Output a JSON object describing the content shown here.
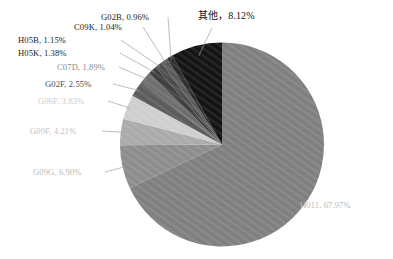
{
  "chart_data": {
    "type": "pie",
    "title": "",
    "legend": "none",
    "start_angle_deg": 0,
    "direction": "clockwise",
    "labels_show_category_and_percent": true,
    "categories": [
      "H011",
      "G09G",
      "G09F",
      "G06F",
      "G02F",
      "C07D",
      "H05K",
      "H05B",
      "C09K",
      "G02B",
      "其他"
    ],
    "values": [
      67.97,
      6.9,
      4.21,
      3.83,
      2.55,
      1.89,
      1.38,
      1.15,
      1.04,
      0.96,
      8.12
    ],
    "unit": "%",
    "slices": [
      {
        "name": "H011",
        "value": 67.97,
        "label": "H011, 67.97%",
        "color": "#808080",
        "label_color": "#b7b7b7"
      },
      {
        "name": "G09G",
        "value": 6.9,
        "label": "G09G, 6.90%",
        "color": "#8d8d8d",
        "label_color": "#b7b7b7"
      },
      {
        "name": "G09F",
        "value": 4.21,
        "label": "G09F, 4.21%",
        "color": "#ababab",
        "label_color": "#c2c2c2"
      },
      {
        "name": "G06F",
        "value": 3.83,
        "label": "G06F, 3.83%",
        "color": "#cfcfcf",
        "label_color": "#cccccc"
      },
      {
        "name": "G02F",
        "value": 2.55,
        "label": "G02F, 2.55%",
        "color": "#5c5c5c",
        "label_color": "#4a4a4a"
      },
      {
        "name": "C07D",
        "value": 1.89,
        "label": "C07D, 1.89%",
        "color": "#6e6e6e",
        "label_color": "#8a8a8a"
      },
      {
        "name": "H05K",
        "value": 1.38,
        "label": "H05K, 1.38%",
        "color": "#3f3f3f",
        "label_color": "#1a1a1a"
      },
      {
        "name": "H05B",
        "value": 1.15,
        "label": "H05B, 1.15%",
        "color": "#4d4d4d",
        "label_color": "#1a1a1a"
      },
      {
        "name": "C09K",
        "value": 1.04,
        "label": "C09K, 1.04%",
        "color": "#5a5a5a",
        "label_color": "#1a1a1a"
      },
      {
        "name": "G02B",
        "value": 0.96,
        "label": "G02B, 0.96%",
        "color": "#2e2e2e",
        "label_color": "#1a1a1a"
      },
      {
        "name": "其他",
        "value": 8.12,
        "label": "其他，8.12%",
        "color": "#141414",
        "label_color": "#111111"
      }
    ]
  },
  "canvas": {
    "background": "#ffffff",
    "leader_line_color": "#a0a0a0"
  }
}
